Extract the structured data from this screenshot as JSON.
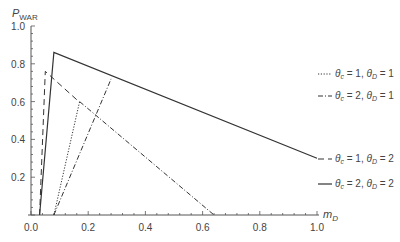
{
  "chart_data": {
    "type": "line",
    "title": "",
    "xlabel": "m_D",
    "ylabel": "P_WAR",
    "xlim": [
      0.0,
      1.0
    ],
    "ylim": [
      0.0,
      1.0
    ],
    "grid": false,
    "legend_position": "right",
    "x_ticks": [
      "0.0",
      "0.2",
      "0.4",
      "0.6",
      "0.8",
      "1.0"
    ],
    "y_ticks": [
      "0.2",
      "0.4",
      "0.6",
      "0.8",
      "1.0"
    ],
    "series": [
      {
        "name": "θc = 1, θD = 1",
        "style": "dotted",
        "points": [
          [
            0.08,
            0.0
          ],
          [
            0.17,
            0.6
          ]
        ]
      },
      {
        "name": "θc = 2, θD = 1",
        "style": "dashdot",
        "points": [
          [
            0.08,
            0.0
          ],
          [
            0.28,
            0.72
          ]
        ],
        "extra_segment": [
          [
            0.17,
            0.6
          ],
          [
            0.64,
            0.0
          ]
        ]
      },
      {
        "name": "θc = 1, θD = 2",
        "style": "dashed",
        "points": [
          [
            0.03,
            0.0
          ],
          [
            0.05,
            0.76
          ],
          [
            0.16,
            0.61
          ]
        ]
      },
      {
        "name": "θc = 2, θD = 2",
        "style": "solid",
        "points": [
          [
            0.03,
            0.0
          ],
          [
            0.08,
            0.86
          ],
          [
            1.0,
            0.3
          ]
        ]
      }
    ]
  },
  "axes": {
    "y_title_main": "P",
    "y_title_sub": "WAR",
    "x_title_main": "m",
    "x_title_sub": "D"
  },
  "legend": [
    {
      "c": "1",
      "d": "1"
    },
    {
      "c": "2",
      "d": "1"
    },
    {
      "c": "1",
      "d": "2"
    },
    {
      "c": "2",
      "d": "2"
    }
  ]
}
